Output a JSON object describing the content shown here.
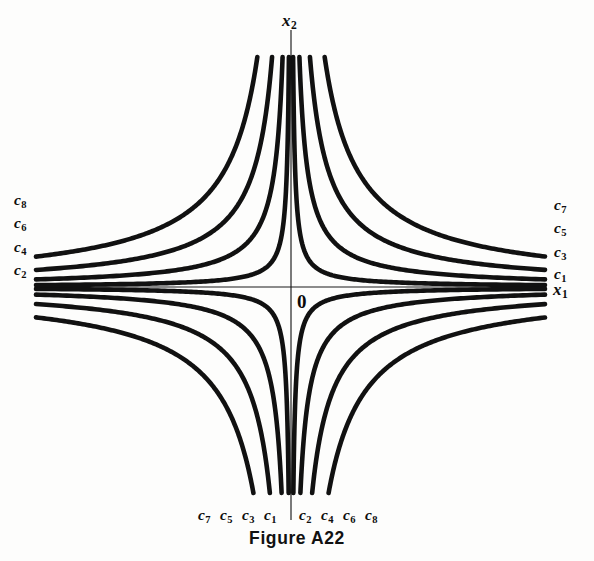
{
  "figure": {
    "caption": "Figure A22",
    "background_color": "#fdfdfc",
    "curve_color": "#111111",
    "axis_color": "#1a1a1a"
  },
  "axes": {
    "x_axis_label": "x",
    "x_axis_subscript": "1",
    "y_axis_label": "x",
    "y_axis_subscript": "2",
    "origin_label": "0"
  },
  "labels": {
    "upper_left": [
      {
        "base": "c",
        "sub": "8"
      },
      {
        "base": "c",
        "sub": "6"
      },
      {
        "base": "c",
        "sub": "4"
      },
      {
        "base": "c",
        "sub": "2"
      }
    ],
    "upper_right": [
      {
        "base": "c",
        "sub": "7"
      },
      {
        "base": "c",
        "sub": "5"
      },
      {
        "base": "c",
        "sub": "3"
      },
      {
        "base": "c",
        "sub": "1"
      }
    ],
    "bottom_left": [
      {
        "base": "c",
        "sub": "7"
      },
      {
        "base": "c",
        "sub": "5"
      },
      {
        "base": "c",
        "sub": "3"
      },
      {
        "base": "c",
        "sub": "1"
      }
    ],
    "bottom_right": [
      {
        "base": "c",
        "sub": "2"
      },
      {
        "base": "c",
        "sub": "4"
      },
      {
        "base": "c",
        "sub": "6"
      },
      {
        "base": "c",
        "sub": "8"
      }
    ]
  },
  "chart_data": {
    "type": "line",
    "title": "Figure A22",
    "subtitle": "Level curves (contours) of a hyperbolic function",
    "xlabel": "x1",
    "ylabel": "x2",
    "grid": false,
    "legend": "inline-endpoint-labels",
    "origin_px": {
      "x": 291,
      "y": 287
    },
    "axis_extent_px": {
      "x_min": 36,
      "x_max": 545,
      "y_min": 30,
      "y_max": 520
    },
    "series": [
      {
        "name": "c1",
        "quadrants": [
          "I",
          "III"
        ],
        "level_rank": 1,
        "asymptote_offset_px": 22,
        "endpoints_px": {
          "quadrant_I": [
            {
              "x": 545,
              "y": 272
            },
            {
              "x": 311,
              "y": 60
            }
          ],
          "quadrant_III": [
            {
              "x": 36,
              "y": 302
            },
            {
              "x": 271,
              "y": 500
            }
          ]
        }
      },
      {
        "name": "c2",
        "quadrants": [
          "II",
          "IV"
        ],
        "level_rank": 2,
        "asymptote_offset_px": 22,
        "endpoints_px": {
          "quadrant_II": [
            {
              "x": 36,
              "y": 270
            },
            {
              "x": 269,
              "y": 60
            }
          ],
          "quadrant_IV": [
            {
              "x": 545,
              "y": 302
            },
            {
              "x": 313,
              "y": 500
            }
          ]
        }
      },
      {
        "name": "c3",
        "quadrants": [
          "I",
          "III"
        ],
        "level_rank": 3,
        "asymptote_offset_px": 44,
        "endpoints_px": {
          "quadrant_I": [
            {
              "x": 545,
              "y": 250
            },
            {
              "x": 332,
              "y": 60
            }
          ],
          "quadrant_III": [
            {
              "x": 36,
              "y": 324
            },
            {
              "x": 250,
              "y": 500
            }
          ]
        }
      },
      {
        "name": "c4",
        "quadrants": [
          "II",
          "IV"
        ],
        "level_rank": 4,
        "asymptote_offset_px": 44,
        "endpoints_px": {
          "quadrant_II": [
            {
              "x": 36,
              "y": 246
            },
            {
              "x": 248,
              "y": 60
            }
          ],
          "quadrant_IV": [
            {
              "x": 545,
              "y": 324
            },
            {
              "x": 334,
              "y": 500
            }
          ]
        }
      },
      {
        "name": "c5",
        "quadrants": [
          "I",
          "III"
        ],
        "level_rank": 5,
        "asymptote_offset_px": 66,
        "endpoints_px": {
          "quadrant_I": [
            {
              "x": 545,
              "y": 228
            },
            {
              "x": 353,
              "y": 60
            }
          ],
          "quadrant_III": [
            {
              "x": 36,
              "y": 346
            },
            {
              "x": 229,
              "y": 500
            }
          ]
        }
      },
      {
        "name": "c6",
        "quadrants": [
          "II",
          "IV"
        ],
        "level_rank": 6,
        "asymptote_offset_px": 66,
        "endpoints_px": {
          "quadrant_II": [
            {
              "x": 36,
              "y": 222
            },
            {
              "x": 227,
              "y": 60
            }
          ],
          "quadrant_IV": [
            {
              "x": 545,
              "y": 346
            },
            {
              "x": 355,
              "y": 500
            }
          ]
        }
      },
      {
        "name": "c7",
        "quadrants": [
          "I",
          "III"
        ],
        "level_rank": 7,
        "asymptote_offset_px": 88,
        "endpoints_px": {
          "quadrant_I": [
            {
              "x": 545,
              "y": 205
            },
            {
              "x": 374,
              "y": 60
            }
          ],
          "quadrant_III": [
            {
              "x": 36,
              "y": 369
            },
            {
              "x": 208,
              "y": 500
            }
          ]
        }
      },
      {
        "name": "c8",
        "quadrants": [
          "II",
          "IV"
        ],
        "level_rank": 8,
        "asymptote_offset_px": 88,
        "endpoints_px": {
          "quadrant_II": [
            {
              "x": 36,
              "y": 199
            },
            {
              "x": 206,
              "y": 60
            }
          ],
          "quadrant_IV": [
            {
              "x": 545,
              "y": 369
            },
            {
              "x": 376,
              "y": 500
            }
          ]
        }
      }
    ]
  }
}
